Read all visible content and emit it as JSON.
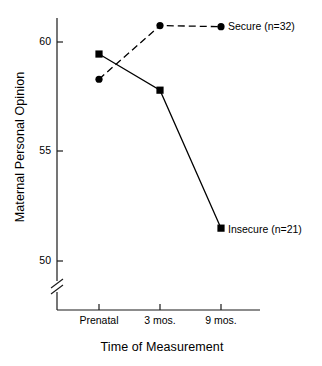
{
  "chart_data": {
    "type": "line",
    "title": "",
    "xlabel": "Time of Measurement",
    "ylabel": "Maternal Personal Opinion",
    "categories": [
      "Prenatal",
      "3 mos.",
      "9 mos."
    ],
    "ytick_labels": [
      "50",
      "55",
      "60"
    ],
    "ytick_values": [
      50,
      55,
      60
    ],
    "ylim": [
      50,
      61.2
    ],
    "grid": false,
    "axis_break": true,
    "legend_position": "inline-right",
    "series": [
      {
        "name": "Secure (n=32)",
        "label": "Secure (n=32)",
        "marker": "circle",
        "linestyle": "dashed",
        "color": "#000000",
        "values": [
          58.3,
          60.75,
          60.7
        ]
      },
      {
        "name": "Insecure (n=21)",
        "label": "Insecure (n=21)",
        "marker": "square",
        "linestyle": "solid",
        "color": "#000000",
        "values": [
          59.45,
          57.8,
          51.5
        ]
      }
    ]
  },
  "axes": {
    "y_title": "Maternal Personal Opinion",
    "x_title": "Time of Measurement",
    "y_ticks": [
      {
        "label": "60"
      },
      {
        "label": "55"
      },
      {
        "label": "50"
      }
    ],
    "x_ticks": [
      {
        "label": "Prenatal"
      },
      {
        "label": "3 mos."
      },
      {
        "label": "9 mos."
      }
    ]
  },
  "annotations": {
    "secure_label": "Secure (n=32)",
    "insecure_label": "Insecure (n=21)"
  }
}
